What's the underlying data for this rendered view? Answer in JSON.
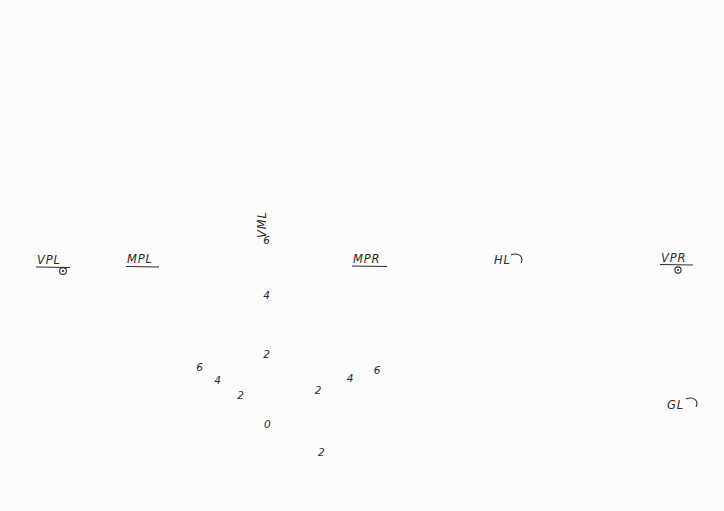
{
  "labels": {
    "vpl": "VPL",
    "mpl": "MPL",
    "vml": "VML",
    "mpr": "MPR",
    "hl": "HL",
    "vpr": "VPR",
    "gl": "GL",
    "origin": "0"
  },
  "scales": {
    "vml": [
      "6",
      "4",
      "2"
    ],
    "left_diagonal_back": [
      "6",
      "4",
      "2"
    ],
    "left_diagonal_front": [
      "2"
    ],
    "right_diagonal": [
      "2",
      "4",
      "6"
    ]
  },
  "colors": {
    "ink": "#2a2a2a",
    "ink_medium": "#3d3d3d",
    "ink_light": "#565656",
    "paper": "#fcfcfb"
  }
}
